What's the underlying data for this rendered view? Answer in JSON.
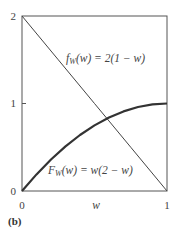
{
  "chart_data": {
    "type": "line",
    "title": "",
    "panel_label": "(b)",
    "xlabel": "w",
    "ylabel": "",
    "xlim": [
      0,
      1
    ],
    "ylim": [
      0,
      2
    ],
    "x_ticks": [
      "0",
      "1"
    ],
    "y_ticks": [
      "0",
      "1",
      "2"
    ],
    "grid": false,
    "legend": "none (inline annotations)",
    "series": [
      {
        "name": "f_W(w) = 2(1 − w)",
        "label_main": "f",
        "label_sub": "W",
        "label_rest": "(w) = 2(1 − w)",
        "style": "thin",
        "x": [
          0,
          0.25,
          0.5,
          0.75,
          1
        ],
        "values": [
          2,
          1.5,
          1,
          0.5,
          0
        ]
      },
      {
        "name": "F_W(w) = w(2 − w)",
        "label_main": "F",
        "label_sub": "W",
        "label_rest": "(w) = w(2 − w)",
        "style": "thick",
        "x": [
          0,
          0.1,
          0.2,
          0.3,
          0.4,
          0.5,
          0.6,
          0.7,
          0.8,
          0.9,
          1
        ],
        "values": [
          0,
          0.19,
          0.36,
          0.51,
          0.64,
          0.75,
          0.84,
          0.91,
          0.96,
          0.99,
          1
        ]
      }
    ],
    "annotations": [
      "f_W(w) = 2(1 − w)",
      "F_W(w) = w(2 − w)"
    ]
  }
}
